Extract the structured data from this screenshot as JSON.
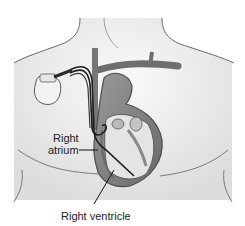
{
  "figure": {
    "labels": {
      "right_atrium_line1": "Right",
      "right_atrium_line2": "atrium",
      "right_ventricle": "Right ventricle"
    }
  },
  "colors": {
    "background": "#ffffff",
    "skin": "#ececec",
    "outline": "#6a6a6a",
    "vessel": "#6e6e6e",
    "heart_dark": "#5a5a5a",
    "heart_mid": "#8a8a8a",
    "heart_light": "#d8d8d8",
    "lead": "#1e1e1e",
    "device": "#eeeeee"
  }
}
